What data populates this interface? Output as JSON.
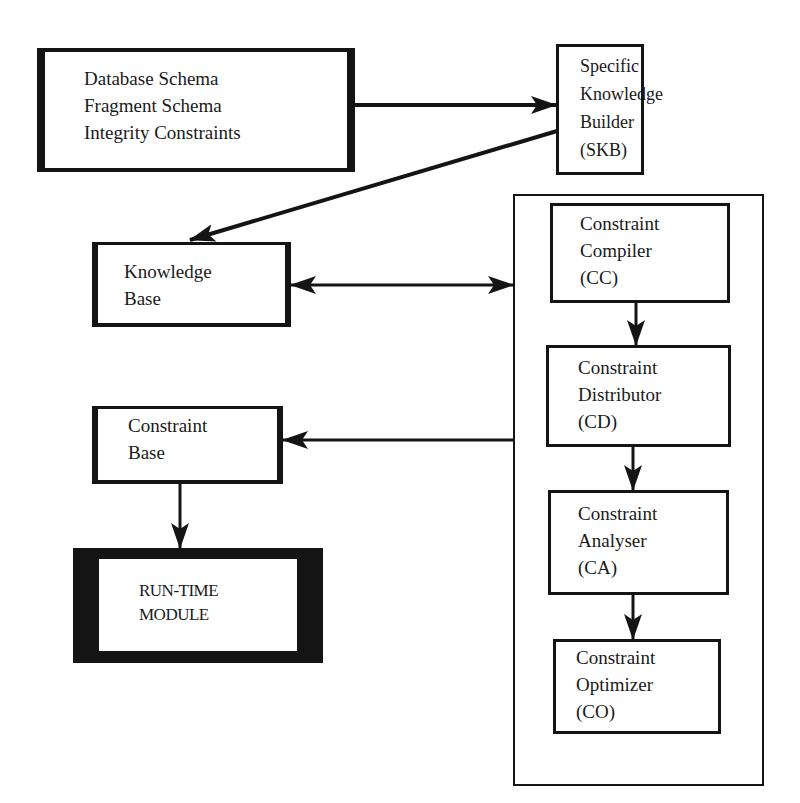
{
  "diagram": {
    "nodes": {
      "schema_input": {
        "lines": [
          "Database Schema",
          "Fragment Schema",
          "Integrity  Constraints"
        ]
      },
      "skb": {
        "lines": [
          "Specific",
          "Knowledge",
          "Builder",
          "(SKB)"
        ]
      },
      "knowledge_base": {
        "lines": [
          "Knowledge",
          "Base"
        ]
      },
      "constraint_base": {
        "lines": [
          "Constraint",
          "Base"
        ]
      },
      "run_time_module": {
        "lines": [
          "RUN-TIME",
          "MODULE"
        ]
      },
      "constraint_compiler": {
        "lines": [
          "Constraint",
          "Compiler",
          "(CC)"
        ]
      },
      "constraint_distributor": {
        "lines": [
          "Constraint",
          "Distributor",
          "(CD)"
        ]
      },
      "constraint_analyser": {
        "lines": [
          "Constraint",
          "Analyser",
          "(CA)"
        ]
      },
      "constraint_optimizer": {
        "lines": [
          "Constraint",
          "Optimizer",
          "(CO)"
        ]
      }
    },
    "edges": [
      {
        "from": "schema_input",
        "to": "skb",
        "type": "arrow"
      },
      {
        "from": "skb",
        "to": "knowledge_base",
        "type": "arrow"
      },
      {
        "from": "knowledge_base",
        "to": "compiler_group",
        "type": "bidirectional"
      },
      {
        "from": "constraint_compiler",
        "to": "constraint_distributor",
        "type": "arrow"
      },
      {
        "from": "constraint_distributor",
        "to": "constraint_analyser",
        "type": "arrow"
      },
      {
        "from": "constraint_analyser",
        "to": "constraint_optimizer",
        "type": "arrow"
      },
      {
        "from": "compiler_group",
        "to": "constraint_base",
        "type": "arrow"
      },
      {
        "from": "constraint_base",
        "to": "run_time_module",
        "type": "arrow"
      }
    ],
    "colors": {
      "stroke": "#141414",
      "background": "#ffffff"
    }
  }
}
